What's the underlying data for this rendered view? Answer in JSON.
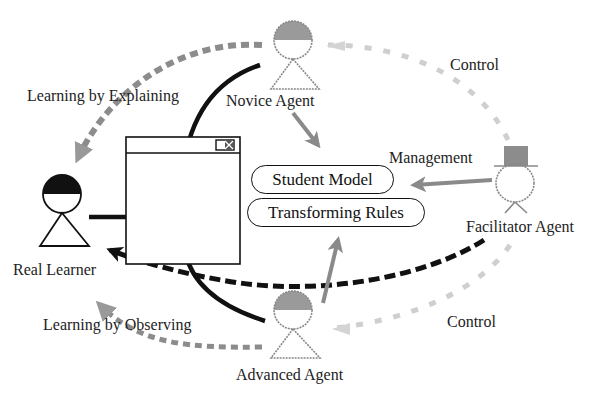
{
  "diagram": {
    "nodes": {
      "real_learner": {
        "label": "Real Learner"
      },
      "novice_agent": {
        "label": "Novice Agent"
      },
      "advanced_agent": {
        "label": "Advanced Agent"
      },
      "facilitator_agent": {
        "label": "Facilitator Agent"
      },
      "student_model": {
        "label": "Student Model"
      },
      "transforming_rules": {
        "label": "Transforming Rules"
      },
      "interface_window": {
        "label": ""
      }
    },
    "edges": {
      "learning_by_explaining": {
        "label": "Learning by Explaining",
        "from": "Novice Agent",
        "to": "Real Learner",
        "style": "gray dashed"
      },
      "learning_by_observing": {
        "label": "Learning by Observing",
        "from": "Advanced Agent",
        "to": "Real Learner",
        "style": "gray dashed"
      },
      "control_top": {
        "label": "Control",
        "from": "Facilitator Agent",
        "to": "Novice Agent",
        "style": "light gray dashed"
      },
      "control_bottom": {
        "label": "Control",
        "from": "Facilitator Agent",
        "to": "Advanced Agent",
        "style": "light gray dashed"
      },
      "management": {
        "label": "Management",
        "from": "Facilitator Agent",
        "to": "Student Model",
        "style": "gray solid"
      },
      "facilitator_to_learner": {
        "label": "",
        "from": "Facilitator Agent",
        "to": "Real Learner",
        "style": "black dashed"
      }
    },
    "colors": {
      "black": "#111111",
      "gray_arrow": "#8a8a8a",
      "light_gray_arrow": "#c8c8c8",
      "hat_fill": "#8c8c8c",
      "head_shade": "#9a9a9a"
    }
  }
}
